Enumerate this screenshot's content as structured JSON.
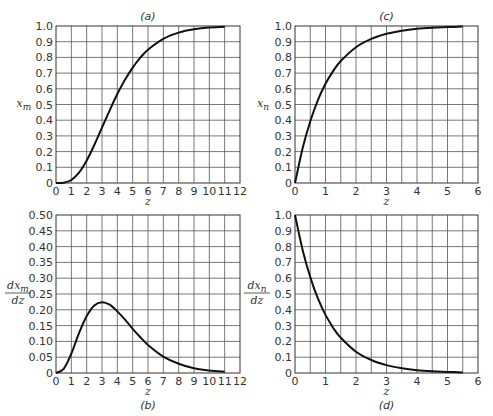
{
  "chart_data": [
    {
      "id": "a",
      "type": "line",
      "title": "(a)",
      "title_position": "top",
      "xlabel": "z",
      "ylabel": "x_m",
      "ylabel_main": "x",
      "ylabel_sub": "m",
      "ylabel_fraction": false,
      "xlim": [
        0,
        12
      ],
      "ylim": [
        0,
        1.0
      ],
      "x_ticks": [
        0,
        1,
        2,
        3,
        4,
        5,
        6,
        7,
        8,
        9,
        10,
        11,
        12
      ],
      "y_ticks": [
        0,
        0.1,
        0.2,
        0.3,
        0.4,
        0.5,
        0.6,
        0.7,
        0.8,
        0.9,
        1.0
      ],
      "y_tick_labels": [
        "0",
        "0.1",
        "0.2",
        "0.3",
        "0.4",
        "0.5",
        "0.6",
        "0.7",
        "0.8",
        "0.9",
        "1.0"
      ],
      "grid": true,
      "frame": {
        "x": 56,
        "y": 26,
        "w": 184,
        "h": 157
      },
      "x": [
        0,
        0.5,
        1,
        1.5,
        2,
        2.5,
        3,
        3.5,
        4,
        4.5,
        5,
        5.5,
        6,
        7,
        8,
        9,
        10,
        11
      ],
      "y": [
        0,
        0.002,
        0.019,
        0.066,
        0.143,
        0.242,
        0.353,
        0.463,
        0.567,
        0.658,
        0.735,
        0.798,
        0.849,
        0.918,
        0.958,
        0.979,
        0.99,
        0.995
      ]
    },
    {
      "id": "b",
      "type": "line",
      "title": "(b)",
      "title_position": "bottom",
      "xlabel": "z",
      "ylabel": "dx_m/dz",
      "ylabel_main": "dx",
      "ylabel_sub": "m",
      "ylabel_fraction": true,
      "xlim": [
        0,
        12
      ],
      "ylim": [
        0,
        0.5
      ],
      "x_ticks": [
        0,
        1,
        2,
        3,
        4,
        5,
        6,
        7,
        8,
        9,
        10,
        11,
        12
      ],
      "y_ticks": [
        0,
        0.05,
        0.1,
        0.15,
        0.2,
        0.25,
        0.3,
        0.35,
        0.4,
        0.45,
        0.5
      ],
      "y_tick_labels": [
        "0",
        "0.05",
        "0.10",
        "0.15",
        "0.20",
        "0.25",
        "0.30",
        "0.35",
        "0.40",
        "0.45",
        "0.50"
      ],
      "grid": true,
      "frame": {
        "x": 56,
        "y": 215,
        "w": 184,
        "h": 158
      },
      "x": [
        0,
        0.5,
        1,
        1.5,
        2,
        2.5,
        3,
        3.5,
        4,
        4.5,
        5,
        5.5,
        6,
        7,
        8,
        9,
        10,
        11
      ],
      "y": [
        0,
        0.013,
        0.061,
        0.126,
        0.18,
        0.214,
        0.224,
        0.216,
        0.195,
        0.169,
        0.14,
        0.113,
        0.089,
        0.052,
        0.029,
        0.015,
        0.008,
        0.004
      ]
    },
    {
      "id": "c",
      "type": "line",
      "title": "(c)",
      "title_position": "top",
      "xlabel": "z",
      "ylabel": "x_n",
      "ylabel_main": "x",
      "ylabel_sub": "n",
      "ylabel_fraction": false,
      "xlim": [
        0,
        6
      ],
      "ylim": [
        0,
        1.0
      ],
      "x_ticks": [
        0,
        1,
        2,
        3,
        4,
        5,
        6
      ],
      "x_minor_step": 0.5,
      "y_ticks": [
        0,
        0.1,
        0.2,
        0.3,
        0.4,
        0.5,
        0.6,
        0.7,
        0.8,
        0.9,
        1.0
      ],
      "y_tick_labels": [
        "0",
        "0.1",
        "0.2",
        "0.3",
        "0.4",
        "0.5",
        "0.6",
        "0.7",
        "0.8",
        "0.9",
        "1.0"
      ],
      "grid": true,
      "frame": {
        "x": 295,
        "y": 26,
        "w": 183,
        "h": 157
      },
      "x": [
        0,
        0.25,
        0.5,
        0.75,
        1,
        1.25,
        1.5,
        2,
        2.5,
        3,
        3.5,
        4,
        4.5,
        5,
        5.5
      ],
      "y": [
        0,
        0.221,
        0.393,
        0.528,
        0.632,
        0.713,
        0.777,
        0.865,
        0.918,
        0.95,
        0.97,
        0.982,
        0.989,
        0.993,
        0.996
      ]
    },
    {
      "id": "d",
      "type": "line",
      "title": "(d)",
      "title_position": "bottom",
      "xlabel": "z",
      "ylabel": "dx_n/dz",
      "ylabel_main": "dx",
      "ylabel_sub": "n",
      "ylabel_fraction": true,
      "xlim": [
        0,
        6
      ],
      "ylim": [
        0,
        1.0
      ],
      "x_ticks": [
        0,
        1,
        2,
        3,
        4,
        5,
        6
      ],
      "x_minor_step": 0.5,
      "y_ticks": [
        0,
        0.1,
        0.2,
        0.3,
        0.4,
        0.5,
        0.6,
        0.7,
        0.8,
        0.9,
        1.0
      ],
      "y_tick_labels": [
        "0",
        "0.1",
        "0.2",
        "0.3",
        "0.4",
        "0.5",
        "0.6",
        "0.7",
        "0.8",
        "0.9",
        "1.0"
      ],
      "grid": true,
      "frame": {
        "x": 295,
        "y": 215,
        "w": 183,
        "h": 158
      },
      "x": [
        0,
        0.25,
        0.5,
        0.75,
        1,
        1.25,
        1.5,
        2,
        2.5,
        3,
        3.5,
        4,
        4.5,
        5,
        5.5
      ],
      "y": [
        1.0,
        0.779,
        0.607,
        0.472,
        0.368,
        0.287,
        0.223,
        0.135,
        0.082,
        0.05,
        0.03,
        0.018,
        0.011,
        0.007,
        0.004
      ]
    }
  ]
}
